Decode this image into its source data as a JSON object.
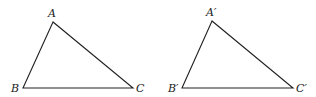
{
  "diagram": {
    "triangles": [
      {
        "name": "triangle-abc",
        "vertices": {
          "A": {
            "label": "A",
            "x": 53,
            "y": 22,
            "lx": 49,
            "ly": 18
          },
          "B": {
            "label": "B",
            "x": 23,
            "y": 88,
            "lx": 11,
            "ly": 92
          },
          "C": {
            "label": "C",
            "x": 133,
            "y": 88,
            "lx": 137,
            "ly": 92
          }
        }
      },
      {
        "name": "triangle-a-prime-b-prime-c-prime",
        "vertices": {
          "A": {
            "label": "A′",
            "x": 212,
            "y": 21,
            "lx": 207,
            "ly": 17
          },
          "B": {
            "label": "B′",
            "x": 182,
            "y": 88,
            "lx": 168,
            "ly": 92
          },
          "C": {
            "label": "C′",
            "x": 293,
            "y": 88,
            "lx": 296,
            "ly": 92
          }
        }
      }
    ],
    "colors": {
      "stroke": "#222222",
      "label": "#1a1a1a",
      "background": "#ffffff"
    }
  }
}
